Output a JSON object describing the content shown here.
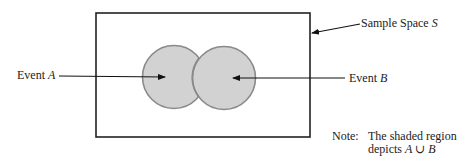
{
  "diagram": {
    "type": "venn",
    "sample_space": {
      "label": "Sample Space ",
      "symbol": "S"
    },
    "event_a": {
      "label": "Event ",
      "symbol": "A"
    },
    "event_b": {
      "label": "Event ",
      "symbol": "B"
    },
    "note": {
      "prefix": "Note:",
      "line1": "The shaded region",
      "line2_text": "depicts ",
      "line2_expr": "A ∪ B"
    },
    "colors": {
      "fill": "#d2d2d2",
      "circle_stroke": "#8a8a8a",
      "frame": "#222222"
    }
  }
}
